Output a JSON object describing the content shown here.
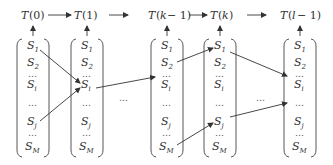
{
  "diagram": {
    "time_labels": [
      "T(0)",
      "T(1)",
      "T(k−1)",
      "T(k)",
      "T(l−1)"
    ],
    "time_labels_parts": [
      {
        "t": "T",
        "arg": "(0)"
      },
      {
        "t": "T",
        "arg": "(1)"
      },
      {
        "t": "T",
        "arg": "(k − 1)"
      },
      {
        "t": "T",
        "arg": "(k)"
      },
      {
        "t": "T",
        "arg": "(l − 1)"
      }
    ],
    "state_rows": [
      {
        "base": "S",
        "sub": "1"
      },
      {
        "base": "S",
        "sub": "2"
      },
      {
        "base": "…",
        "sub": ""
      },
      {
        "base": "S",
        "sub": "i"
      },
      {
        "base": "…",
        "sub": ""
      },
      {
        "base": "S",
        "sub": "j"
      },
      {
        "base": "…",
        "sub": ""
      },
      {
        "base": "S",
        "sub": "M"
      }
    ],
    "gap_ellipsis": "…",
    "transitions": [
      {
        "from_col": 0,
        "from": "S1",
        "to_col": 1,
        "to": "Si"
      },
      {
        "from_col": 0,
        "from": "Sj",
        "to_col": 1,
        "to": "Si"
      },
      {
        "from_col": 1,
        "from": "Si",
        "to_col": 2,
        "to": "dots"
      },
      {
        "from_col": 2,
        "from": "S2",
        "to_col": 3,
        "to": "S1"
      },
      {
        "from_col": 3,
        "from": "S1",
        "to_col": 4,
        "to": "dots"
      },
      {
        "from_col": 2,
        "from": "SM",
        "to_col": 3,
        "to": "Sj"
      },
      {
        "from_col": 3,
        "from": "Sj",
        "to_col": 4,
        "to": "dots"
      }
    ]
  }
}
